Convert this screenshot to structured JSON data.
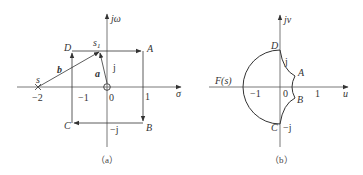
{
  "figure_a": {
    "caption": "（a）",
    "axes": {
      "x_label": "σ",
      "y_label": "jω"
    },
    "ticks": {
      "x_neg2": "−2",
      "x_neg1": "−1",
      "x_0": "0",
      "x_1": "1",
      "y_pos": "j",
      "y_neg": "−j"
    },
    "points": {
      "A": "A",
      "B": "B",
      "C": "C",
      "D": "D",
      "s": "s",
      "s1": "s",
      "s1_sub": "1"
    },
    "vectors": {
      "a": "a",
      "b": "b"
    },
    "contour_order": [
      "A",
      "B",
      "C",
      "D",
      "A"
    ]
  },
  "figure_b": {
    "caption": "（b）",
    "axes": {
      "x_label": "u",
      "y_label": "jv"
    },
    "ticks": {
      "x_neg1": "−1",
      "x_0": "0",
      "x_1": "1",
      "y_pos": "j",
      "y_neg": "−j"
    },
    "points": {
      "A": "A",
      "B": "B",
      "C": "C",
      "D": "D"
    },
    "function_label": "F(s)"
  },
  "colors": {
    "line": "#333333",
    "axis": "#555555"
  }
}
